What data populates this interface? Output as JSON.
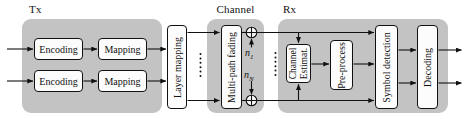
{
  "diagram": {
    "regions": {
      "tx": {
        "label": "Tx"
      },
      "channel": {
        "label": "Channel"
      },
      "rx": {
        "label": "Rx"
      }
    },
    "blocks": {
      "encoding_top": {
        "label": "Encoding"
      },
      "encoding_bottom": {
        "label": "Encoding"
      },
      "mapping_top": {
        "label": "Mapping"
      },
      "mapping_bottom": {
        "label": "Mapping"
      },
      "layer_mapping": {
        "label": "Layer mapping"
      },
      "multipath_fading": {
        "label": "Multi-path fading"
      },
      "channel_estimator": {
        "line1": "Channel",
        "line2": "Estimat."
      },
      "preprocess": {
        "label": "Pre-process"
      },
      "symbol_detection": {
        "label": "Symbol detection"
      },
      "decoding": {
        "label": "Decoding"
      }
    },
    "noise": {
      "n1": {
        "base": "n",
        "sub": "1"
      },
      "nN": {
        "base": "n",
        "sub": "N"
      }
    },
    "colors": {
      "region_fill": "#c3c3c3",
      "block_fill": "#fcfcfc",
      "line": "#111111"
    }
  }
}
